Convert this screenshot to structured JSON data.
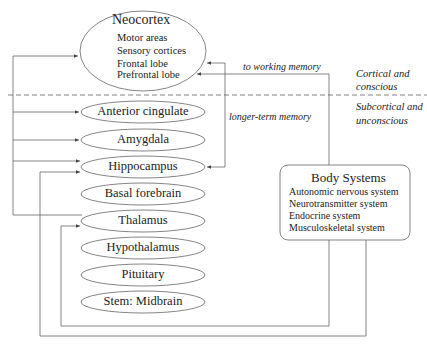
{
  "neocortex": {
    "title": "Neocortex",
    "items": [
      "Motor areas",
      "Sensory cortices",
      "Frontal lobe",
      "Prefrontal lobe"
    ]
  },
  "subcortical_structures": [
    "Anterior cingulate",
    "Amygdala",
    "Hippocampus",
    "Basal forebrain",
    "Thalamus",
    "Hypothalamus",
    "Pituitary",
    "Stem: Midbrain"
  ],
  "body_systems": {
    "title": "Body Systems",
    "items": [
      "Autonomic nervous system",
      "Neurotransmitter system",
      "Endocrine system",
      "Musculoskeletal system"
    ]
  },
  "annotations": {
    "to_working_memory": "to working memory",
    "longer_term_memory": "longer-term memory"
  },
  "regions": {
    "upper": [
      "Cortical and",
      "conscious"
    ],
    "lower": [
      "Subcortical and",
      "unconscious"
    ]
  },
  "colors": {
    "line": "#555555",
    "text": "#222222",
    "background": "#ffffff"
  }
}
